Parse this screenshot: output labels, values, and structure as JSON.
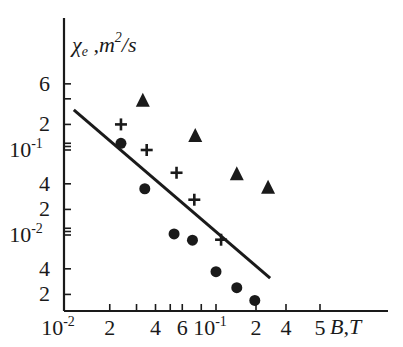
{
  "chart_data": {
    "type": "scatter",
    "title": "",
    "xlabel": "B,T",
    "ylabel": "χe ,m²/s",
    "ylabel_parts": {
      "symbol": "χ",
      "sub": "e",
      "unit_pre": " ,m",
      "unit_sup": "2",
      "unit_post": "/s"
    },
    "xscale": "log",
    "yscale": "log",
    "xlim": [
      0.01,
      0.55
    ],
    "ylim": [
      0.0012,
      1.2
    ],
    "grid": false,
    "legend": "none",
    "x_ticks": [
      {
        "value": 0.01,
        "label": "10",
        "exp": "-2"
      },
      {
        "value": 0.02,
        "label": "2"
      },
      {
        "value": 0.03,
        "label": ""
      },
      {
        "value": 0.04,
        "label": "4"
      },
      {
        "value": 0.05,
        "label": ""
      },
      {
        "value": 0.06,
        "label": "6"
      },
      {
        "value": 0.08,
        "label": ""
      },
      {
        "value": 0.1,
        "label": "10",
        "exp": "-1"
      },
      {
        "value": 0.2,
        "label": "2"
      },
      {
        "value": 0.3,
        "label": "4"
      },
      {
        "value": 0.5,
        "label": "5"
      }
    ],
    "y_ticks": [
      {
        "value": 0.6,
        "label": "6"
      },
      {
        "value": 0.4,
        "label": ""
      },
      {
        "value": 0.2,
        "label": "2"
      },
      {
        "value": 0.12,
        "label": ""
      },
      {
        "value": 0.11,
        "label": ""
      },
      {
        "value": 0.1,
        "label": "10",
        "exp": "-1"
      },
      {
        "value": 0.04,
        "label": "4"
      },
      {
        "value": 0.02,
        "label": "2"
      },
      {
        "value": 0.012,
        "label": ""
      },
      {
        "value": 0.011,
        "label": ""
      },
      {
        "value": 0.01,
        "label": "10",
        "exp": "-2"
      },
      {
        "value": 0.004,
        "label": "4"
      },
      {
        "value": 0.002,
        "label": "2"
      }
    ],
    "series": [
      {
        "name": "triangles",
        "marker": "triangle",
        "points": [
          {
            "x": 0.033,
            "y": 0.38
          },
          {
            "x": 0.073,
            "y": 0.146
          },
          {
            "x": 0.137,
            "y": 0.052
          },
          {
            "x": 0.22,
            "y": 0.036
          }
        ]
      },
      {
        "name": "crosses",
        "marker": "plus",
        "points": [
          {
            "x": 0.0237,
            "y": 0.2
          },
          {
            "x": 0.035,
            "y": 0.1
          },
          {
            "x": 0.055,
            "y": 0.054
          },
          {
            "x": 0.072,
            "y": 0.026
          },
          {
            "x": 0.108,
            "y": 0.0088
          }
        ]
      },
      {
        "name": "circles",
        "marker": "circle",
        "points": [
          {
            "x": 0.0237,
            "y": 0.12
          },
          {
            "x": 0.034,
            "y": 0.035
          },
          {
            "x": 0.053,
            "y": 0.0103
          },
          {
            "x": 0.07,
            "y": 0.0087
          },
          {
            "x": 0.1,
            "y": 0.0037
          },
          {
            "x": 0.137,
            "y": 0.0024
          },
          {
            "x": 0.18,
            "y": 0.0017
          }
        ]
      },
      {
        "name": "fit-line",
        "marker": "line",
        "points": [
          {
            "x": 0.0116,
            "y": 0.296
          },
          {
            "x": 0.227,
            "y": 0.0031
          }
        ]
      }
    ],
    "colors": {
      "ink": "#1a1a1a",
      "background": "#ffffff"
    }
  }
}
